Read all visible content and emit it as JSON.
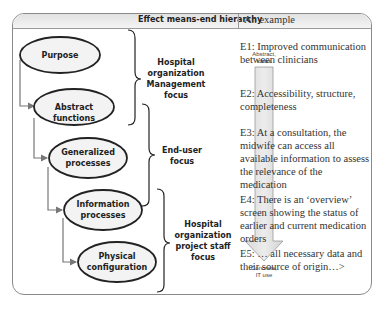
{
  "header": {
    "left_title": "Effect means-end hierarchy",
    "right_title": "An example"
  },
  "levels": [
    {
      "label_lines": [
        "Purpose"
      ]
    },
    {
      "label_lines": [
        "Abstract functions"
      ]
    },
    {
      "label_lines": [
        "Generalized",
        "processes"
      ]
    },
    {
      "label_lines": [
        "Information",
        "processes"
      ]
    },
    {
      "label_lines": [
        "Physical",
        "configuration"
      ]
    }
  ],
  "focus_groups": [
    {
      "label_lines": [
        "Hospital",
        "organization",
        "Management",
        "focus"
      ]
    },
    {
      "label_lines": [
        "End-user",
        "focus"
      ]
    },
    {
      "label_lines": [
        "Hospital",
        "organization",
        "project staff",
        "focus"
      ]
    }
  ],
  "abstraction_arrow": {
    "top_label_lines": [
      "Abstract,",
      "ideas"
    ],
    "bottom_label_lines": [
      "Concrete,",
      "IT use"
    ]
  },
  "examples": [
    {
      "text": "E1: Improved communication between clinicians"
    },
    {
      "text": "E2: Accessibility, structure, completeness"
    },
    {
      "text": "E3: At a consultation, the midwife can access all available information to assess the relevance of the medication"
    },
    {
      "text": "E4: There is an ‘overview’ screen showing the status of earlier and current medication orders"
    },
    {
      "text": "E5: … all necessary data and their source of origin…>"
    }
  ]
}
